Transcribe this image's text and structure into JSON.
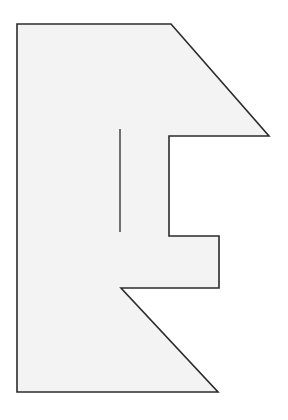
{
  "document": {
    "title": "Geometric Figure",
    "kind": "line-drawing",
    "canvas": {
      "width": 288,
      "height": 420
    },
    "background_color": "#ffffff"
  },
  "figure": {
    "name": "irregular-polygon",
    "fill_color": "#f3f3f3",
    "stroke_color": "#2b2b2b",
    "stroke_width": 1.6,
    "vertices": [
      {
        "label": "top-left-corner",
        "x": 17,
        "y": 24
      },
      {
        "label": "top-edge-end",
        "x": 171,
        "y": 24
      },
      {
        "label": "upper-diagonal-right-point",
        "x": 269,
        "y": 136
      },
      {
        "label": "upper-notch-inner-left",
        "x": 169,
        "y": 136
      },
      {
        "label": "upper-notch-inner-bottom",
        "x": 169,
        "y": 236
      },
      {
        "label": "middle-step-right",
        "x": 219,
        "y": 236
      },
      {
        "label": "middle-step-bottom-right",
        "x": 219,
        "y": 288
      },
      {
        "label": "lower-notch-inner-left",
        "x": 121,
        "y": 288
      },
      {
        "label": "bottom-diagonal-right-point",
        "x": 218,
        "y": 392
      },
      {
        "label": "bottom-left-corner",
        "x": 17,
        "y": 392
      }
    ],
    "interior_lines": [
      {
        "label": "interior-slit",
        "x1": 120,
        "y1": 129,
        "x2": 120,
        "y2": 232,
        "stroke_color": "#2b2b2b",
        "stroke_width": 1.3
      }
    ]
  }
}
